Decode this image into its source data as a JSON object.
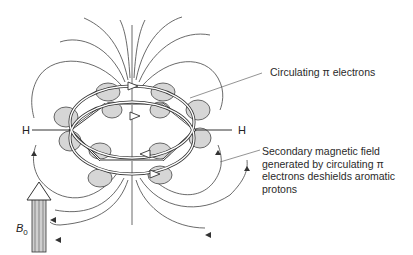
{
  "diagram": {
    "labels": {
      "circulating": "Circulating π electrons",
      "secondary_line1": "Secondary magnetic field",
      "secondary_line2": "generated by circulating π",
      "secondary_line3": "electrons deshields aromatic",
      "secondary_line4": "protons",
      "h_left": "H",
      "h_right": "H",
      "b0_symbol": "B",
      "b0_subscript": "0"
    },
    "colors": {
      "line": "#333333",
      "orbital_fill": "#d6d6d6",
      "text": "#2a2a2a"
    }
  }
}
